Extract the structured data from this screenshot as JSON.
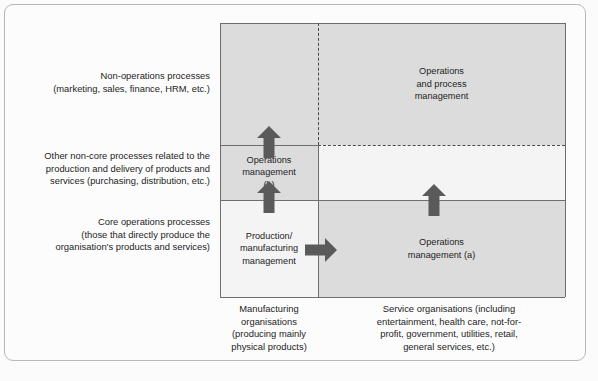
{
  "diagram": {
    "colors": {
      "shaded_cell": "#dcdcdc",
      "plain_cell": "#f4f4f4",
      "arrow": "#5a5a5a",
      "solid_line": "#6e6e6e",
      "dashed_line": "#4a4a4a",
      "frame": "#b8b8b8",
      "text": "#1c1c1c"
    },
    "row_labels": [
      {
        "id": "non-operations-processes",
        "lines": [
          "Non-operations processes",
          "(marketing, sales, finance, HRM, etc.)"
        ]
      },
      {
        "id": "other-non-core-processes",
        "lines": [
          "Other non-core processes related to the",
          "production and delivery of products and",
          "services (purchasing, distribution, etc.)"
        ]
      },
      {
        "id": "core-operations-processes",
        "lines": [
          "Core operations processes",
          "(those that directly produce the",
          "organisation's products and services)"
        ]
      }
    ],
    "column_labels": [
      {
        "id": "manufacturing-organisations",
        "lines": [
          "Manufacturing",
          "organisations",
          "(producing mainly",
          "physical products)"
        ]
      },
      {
        "id": "service-organisations",
        "lines": [
          "Service organisations (including",
          "entertainment, health care, not-for-",
          "profit, government, utilities, retail,",
          "general services, etc.)"
        ]
      }
    ],
    "cells": [
      {
        "id": "top-left",
        "row": "non-operations-processes",
        "column": "manufacturing-organisations",
        "lines": [],
        "shaded": true
      },
      {
        "id": "top-right",
        "row": "non-operations-processes",
        "column": "service-organisations",
        "lines": [
          "Operations",
          "and process",
          "management"
        ],
        "shaded": true
      },
      {
        "id": "middle-left",
        "row": "other-non-core-processes",
        "column": "manufacturing-organisations",
        "lines": [
          "Operations",
          "management",
          "(b)"
        ],
        "shaded": true
      },
      {
        "id": "middle-right",
        "row": "other-non-core-processes",
        "column": "service-organisations",
        "lines": [],
        "shaded": false
      },
      {
        "id": "bottom-left",
        "row": "core-operations-processes",
        "column": "manufacturing-organisations",
        "lines": [
          "Production/",
          "manufacturing",
          "management"
        ],
        "shaded": false
      },
      {
        "id": "bottom-right",
        "row": "core-operations-processes",
        "column": "service-organisations",
        "lines": [
          "Operations",
          "management (a)"
        ],
        "shaded": true
      }
    ],
    "arrows": [
      {
        "id": "arrow-up-from-production-to-operations-b",
        "direction": "up"
      },
      {
        "id": "arrow-up-from-operations-b-to-non-operations",
        "direction": "up"
      },
      {
        "id": "arrow-right-from-production-to-operations-a",
        "direction": "right"
      },
      {
        "id": "arrow-up-from-operations-a-to-middle-right",
        "direction": "up"
      }
    ]
  }
}
